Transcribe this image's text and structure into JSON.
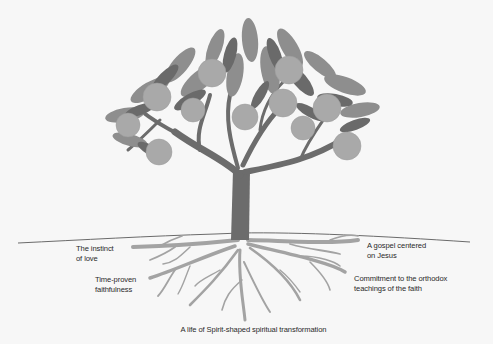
{
  "diagram": {
    "type": "illustration",
    "colors": {
      "background": "#f7f7f7",
      "trunk": "#6c6c6c",
      "roots": "#a3a3a3",
      "leaf_dark": "#6a6a6a",
      "leaf_light": "#8e8e8e",
      "fruit": "#a9a9a9",
      "ground_line": "#5a5a5a",
      "text": "#2a2a2a"
    },
    "labels": {
      "left_top": [
        "The instinct",
        "of love"
      ],
      "left_bottom": [
        "Time-proven",
        "faithfulness"
      ],
      "right_top": [
        "A gospel centered",
        "on Jesus"
      ],
      "right_bottom": [
        "Commitment to the orthodox",
        "teachings of the faith"
      ],
      "caption": "A life of Spirit-shaped spiritual transformation"
    }
  }
}
